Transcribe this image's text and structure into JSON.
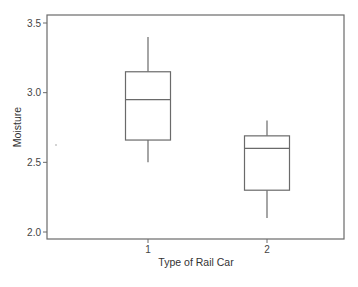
{
  "chart_data": {
    "type": "box",
    "title": "",
    "xlabel": "Type of Rail Car",
    "ylabel": "Moisture",
    "ylim": [
      1.95,
      3.56
    ],
    "yticks": [
      {
        "value": 2.0,
        "label": "2.0"
      },
      {
        "value": 2.5,
        "label": "2.5"
      },
      {
        "value": 3.0,
        "label": "3.0"
      },
      {
        "value": 3.5,
        "label": "3.5"
      }
    ],
    "categories": [
      "1",
      "2"
    ],
    "grid": false,
    "legend": "none",
    "boxes": [
      {
        "category": "1",
        "whisker_low": 2.5,
        "q1": 2.66,
        "median": 2.95,
        "q3": 3.15,
        "whisker_high": 3.4
      },
      {
        "category": "2",
        "whisker_low": 2.1,
        "q1": 2.3,
        "median": 2.6,
        "q3": 2.69,
        "whisker_high": 2.8
      }
    ]
  }
}
